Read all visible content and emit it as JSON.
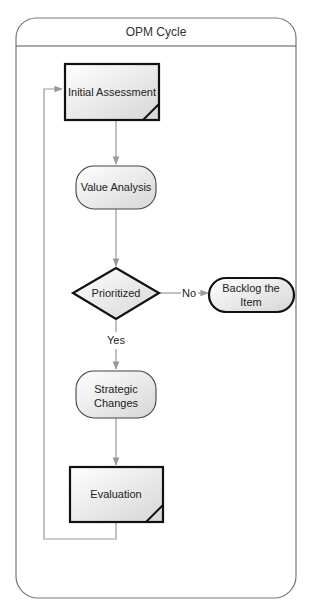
{
  "diagram": {
    "title": "OPM Cycle",
    "colors": {
      "frame": "#777777",
      "connector": "#999999",
      "node_stroke": "#111111",
      "node_fill_light": "#ffffff",
      "node_fill_dark": "#dcdcdc"
    },
    "nodes": {
      "initial_assessment": {
        "label": "Initial Assessment",
        "shape": "document-process"
      },
      "value_analysis": {
        "label": "Value Analysis",
        "shape": "rounded-process"
      },
      "prioritized": {
        "label": "Prioritized",
        "shape": "decision"
      },
      "backlog": {
        "label_line1": "Backlog the",
        "label_line2": "Item",
        "shape": "terminator"
      },
      "strategic_changes": {
        "label_line1": "Strategic",
        "label_line2": "Changes",
        "shape": "rounded-process"
      },
      "evaluation": {
        "label": "Evaluation",
        "shape": "document-process"
      }
    },
    "edges": {
      "no_label": "No",
      "yes_label": "Yes"
    }
  }
}
